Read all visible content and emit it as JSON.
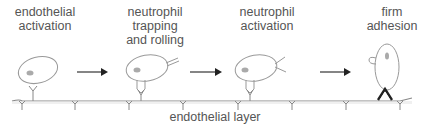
{
  "diagram": {
    "stages": [
      {
        "id": "endothelial-activation",
        "label": "endothelial\nactivation"
      },
      {
        "id": "neutrophil-trapping-rolling",
        "label": "neutrophil\ntrapping\nand rolling"
      },
      {
        "id": "neutrophil-activation",
        "label": "neutrophil\nactivation"
      },
      {
        "id": "firm-adhesion",
        "label": "firm\nadhesion"
      }
    ],
    "arrows": 3,
    "base_label": "endothelial layer",
    "colors": {
      "text": "#555555",
      "outline": "#999999",
      "nucleus": "#aaaaaa",
      "layer": "#888888",
      "arrow": "#333333",
      "adhesion": "#222222"
    }
  }
}
